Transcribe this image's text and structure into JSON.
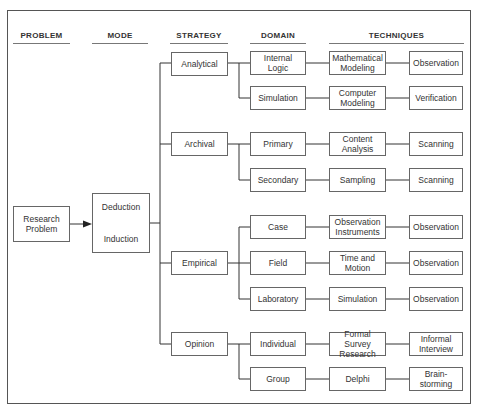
{
  "headers": {
    "problem": "PROBLEM",
    "mode": "MODE",
    "strategy": "STRATEGY",
    "domain": "DOMAIN",
    "techniques": "TECHNIQUES"
  },
  "problem": {
    "label": "Research\nProblem"
  },
  "mode": {
    "top": "Deduction",
    "bottom": "Induction"
  },
  "strategies": [
    {
      "label": "Analytical",
      "domains": [
        {
          "label": "Internal\nLogic",
          "technique1": "Mathematical\nModeling",
          "technique2": "Observation"
        },
        {
          "label": "Simulation",
          "technique1": "Computer\nModeling",
          "technique2": "Verification"
        }
      ]
    },
    {
      "label": "Archival",
      "domains": [
        {
          "label": "Primary",
          "technique1": "Content\nAnalysis",
          "technique2": "Scanning"
        },
        {
          "label": "Secondary",
          "technique1": "Sampling",
          "technique2": "Scanning"
        }
      ]
    },
    {
      "label": "Empirical",
      "domains": [
        {
          "label": "Case",
          "technique1": "Observation\nInstruments",
          "technique2": "Observation"
        },
        {
          "label": "Field",
          "technique1": "Time and\nMotion",
          "technique2": "Observation"
        },
        {
          "label": "Laboratory",
          "technique1": "Simulation",
          "technique2": "Observation"
        }
      ]
    },
    {
      "label": "Opinion",
      "domains": [
        {
          "label": "Individual",
          "technique1": "Formal Survey\nResearch",
          "technique2": "Informal\nInterview"
        },
        {
          "label": "Group",
          "technique1": "Delphi",
          "technique2": "Brain-\nstorming"
        }
      ]
    }
  ]
}
